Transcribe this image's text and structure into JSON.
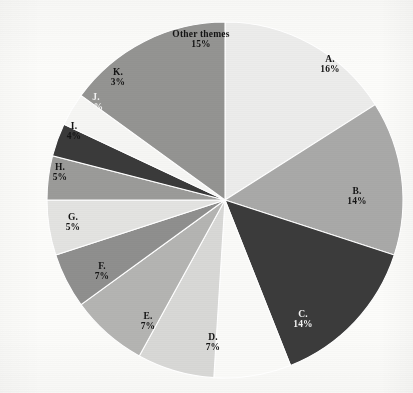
{
  "chart_data": {
    "type": "pie",
    "title": "",
    "subtitle": "",
    "xlabel": "",
    "ylabel": "",
    "legend_position": "none",
    "grid": false,
    "labels_inside": true,
    "units": "percent",
    "start_angle_deg": 0,
    "direction": "clockwise",
    "center": {
      "x": 225,
      "y": 200
    },
    "radius": 178,
    "categories": [
      "A.",
      "B.",
      "C.",
      "D.",
      "E.",
      "F.",
      "G.",
      "H.",
      "I.",
      "J.",
      "K.",
      "Other themes"
    ],
    "values": [
      16,
      14,
      14,
      7,
      7,
      7,
      5,
      5,
      4,
      3,
      3,
      15
    ],
    "value_labels": [
      "16%",
      "14%",
      "14%",
      "7%",
      "7%",
      "7%",
      "5%",
      "5%",
      "4%",
      "3%",
      "3%",
      "15%"
    ],
    "slices": [
      {
        "name": "A.",
        "value": 16,
        "value_label": "16%",
        "color": "#ececeb",
        "text_color": "#141414",
        "label_x": 330,
        "label_y": 61,
        "font_size": 9.5
      },
      {
        "name": "B.",
        "value": 14,
        "value_label": "14%",
        "color": "#a9a9a8",
        "text_color": "#141414",
        "label_x": 357,
        "label_y": 193,
        "font_size": 9.5
      },
      {
        "name": "C.",
        "value": 14,
        "value_label": "14%",
        "color": "#3b3b3b",
        "text_color": "#f4f4f4",
        "label_x": 303,
        "label_y": 316,
        "font_size": 9.5
      },
      {
        "name": "D.",
        "value": 7,
        "value_label": "7%",
        "color": "#fafaf8",
        "text_color": "#141414",
        "label_x": 213,
        "label_y": 339,
        "font_size": 9.5
      },
      {
        "name": "E.",
        "value": 7,
        "value_label": "7%",
        "color": "#d8d8d6",
        "text_color": "#141414",
        "label_x": 148,
        "label_y": 318,
        "font_size": 9.5
      },
      {
        "name": "F.",
        "value": 7,
        "value_label": "7%",
        "color": "#b4b4b2",
        "text_color": "#141414",
        "label_x": 102,
        "label_y": 268,
        "font_size": 9.5
      },
      {
        "name": "G.",
        "value": 5,
        "value_label": "5%",
        "color": "#8f8f8e",
        "text_color": "#141414",
        "label_x": 73,
        "label_y": 219,
        "font_size": 9.5
      },
      {
        "name": "H.",
        "value": 5,
        "value_label": "5%",
        "color": "#e3e3e1",
        "text_color": "#141414",
        "label_x": 60,
        "label_y": 169,
        "font_size": 9.5
      },
      {
        "name": "I.",
        "value": 4,
        "value_label": "4%",
        "color": "#9b9b99",
        "text_color": "#141414",
        "label_x": 74,
        "label_y": 128,
        "font_size": 9.5
      },
      {
        "name": "J.",
        "value": 3,
        "value_label": "3%",
        "color": "#3a3a3a",
        "text_color": "#f4f4f4",
        "label_x": 96,
        "label_y": 99,
        "font_size": 9.5
      },
      {
        "name": "K.",
        "value": 3,
        "value_label": "3%",
        "color": "#f6f6f4",
        "text_color": "#141414",
        "label_x": 118,
        "label_y": 74,
        "font_size": 9.5
      },
      {
        "name": "Other themes",
        "value": 15,
        "value_label": "15%",
        "color": "#949492",
        "text_color": "#141414",
        "label_x": 201,
        "label_y": 36,
        "font_size": 9.5
      }
    ],
    "background_color": "#fcfcfa",
    "slice_separator_color": "#ffffff"
  }
}
